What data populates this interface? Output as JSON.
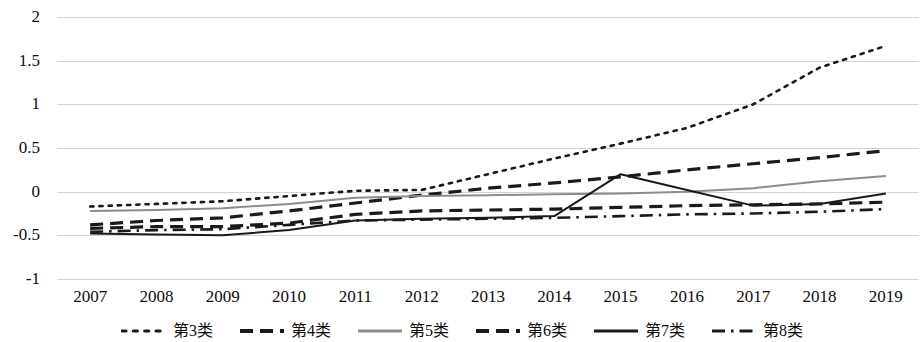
{
  "chart_data": {
    "type": "line",
    "title": "",
    "xlabel": "",
    "ylabel": "",
    "grid": true,
    "legend_position": "bottom",
    "xlim": [
      2007,
      2019
    ],
    "ylim": [
      -1,
      2
    ],
    "yticks": [
      2,
      1.5,
      1,
      0.5,
      0,
      -0.5,
      -1
    ],
    "ytick_labels": [
      "2",
      "1.5",
      "1",
      "0.5",
      "0",
      "-0.5",
      "-1"
    ],
    "categories": [
      2007,
      2008,
      2009,
      2010,
      2011,
      2012,
      2013,
      2014,
      2015,
      2016,
      2017,
      2018,
      2019
    ],
    "xtick_labels": [
      "2007",
      "2008",
      "2009",
      "2010",
      "2011",
      "2012",
      "2013",
      "2014",
      "2015",
      "2016",
      "2017",
      "2018",
      "2019"
    ],
    "series": [
      {
        "name": "第3类",
        "style": "dotted",
        "color": "#1a1a1a",
        "values": [
          -0.17,
          -0.14,
          -0.11,
          -0.05,
          0.01,
          0.02,
          0.2,
          0.38,
          0.55,
          0.73,
          1.0,
          1.42,
          1.67
        ]
      },
      {
        "name": "第4类",
        "style": "dashed",
        "color": "#1a1a1a",
        "values": [
          -0.38,
          -0.33,
          -0.3,
          -0.22,
          -0.13,
          -0.04,
          0.04,
          0.1,
          0.17,
          0.25,
          0.32,
          0.39,
          0.47
        ]
      },
      {
        "name": "第5类",
        "style": "solid",
        "color": "#8c8c8c",
        "values": [
          -0.22,
          -0.21,
          -0.19,
          -0.14,
          -0.07,
          -0.05,
          -0.04,
          -0.03,
          -0.02,
          0.0,
          0.04,
          0.12,
          0.18
        ]
      },
      {
        "name": "第6类",
        "style": "dashed",
        "color": "#1a1a1a",
        "values": [
          -0.42,
          -0.4,
          -0.4,
          -0.36,
          -0.26,
          -0.22,
          -0.21,
          -0.2,
          -0.18,
          -0.16,
          -0.15,
          -0.14,
          -0.12
        ]
      },
      {
        "name": "第7类",
        "style": "solid",
        "color": "#1a1a1a",
        "values": [
          -0.48,
          -0.49,
          -0.5,
          -0.44,
          -0.33,
          -0.31,
          -0.3,
          -0.28,
          0.2,
          0.02,
          -0.16,
          -0.14,
          -0.02
        ]
      },
      {
        "name": "第8类",
        "style": "dashdot",
        "color": "#1a1a1a",
        "values": [
          -0.46,
          -0.44,
          -0.43,
          -0.38,
          -0.33,
          -0.32,
          -0.31,
          -0.3,
          -0.28,
          -0.26,
          -0.25,
          -0.23,
          -0.2
        ]
      }
    ]
  }
}
